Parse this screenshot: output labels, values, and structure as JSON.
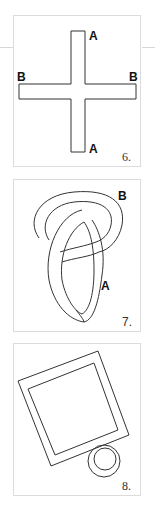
{
  "figures": [
    {
      "number": "6.",
      "shape": "cross",
      "labels": {
        "top": "A",
        "bottom": "A",
        "left": "B",
        "right": "B"
      }
    },
    {
      "number": "7.",
      "shape": "knotted-loop",
      "labels": {
        "upper_right": "B",
        "middle_right": "A"
      }
    },
    {
      "number": "8.",
      "shape": "tilted-square-frame-with-ring",
      "labels": {}
    }
  ],
  "colors": {
    "stroke": "#333333",
    "panel_border": "#dcdcdc",
    "rule": "#d8d8d8"
  }
}
